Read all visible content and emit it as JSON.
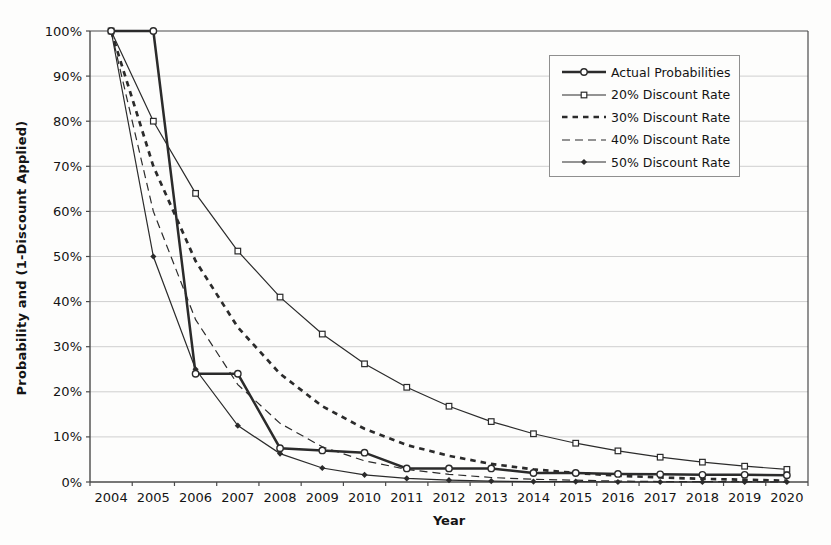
{
  "figure": {
    "background_color": "#fdfdfc",
    "series_color": "#2b2b2b",
    "grid_color": "#cfcfcf",
    "axis_color": "#4a4a4a",
    "text_color": "#141414"
  },
  "chart_data": {
    "type": "line",
    "title": "",
    "xlabel": "Year",
    "ylabel": "Probability and (1-Discount Applied)",
    "ylim": [
      0,
      100
    ],
    "grid": "horizontal",
    "legend_position": "top-right-inside",
    "x": [
      2004,
      2005,
      2006,
      2007,
      2008,
      2009,
      2010,
      2011,
      2012,
      2013,
      2014,
      2015,
      2016,
      2017,
      2018,
      2019,
      2020
    ],
    "x_tick_labels": [
      "2004",
      "2005",
      "2006",
      "2007",
      "2008",
      "2009",
      "2010",
      "2011",
      "2012",
      "2013",
      "2014",
      "2015",
      "2016",
      "2017",
      "2018",
      "2019",
      "2020"
    ],
    "y_tick_labels": [
      "0%",
      "10%",
      "20%",
      "30%",
      "40%",
      "50%",
      "60%",
      "70%",
      "80%",
      "90%",
      "100%"
    ],
    "series": [
      {
        "name": "Actual Probabilities",
        "values": [
          100,
          100,
          24,
          24,
          7.5,
          7,
          6.5,
          3,
          3,
          3,
          2,
          2,
          1.8,
          1.7,
          1.6,
          1.6,
          1.5
        ],
        "line": "thick-solid",
        "marker": "circle-open"
      },
      {
        "name": "20% Discount Rate",
        "values": [
          100,
          80,
          64,
          51.2,
          41,
          32.8,
          26.2,
          21,
          16.8,
          13.4,
          10.7,
          8.6,
          6.9,
          5.5,
          4.4,
          3.5,
          2.8
        ],
        "line": "thin-solid",
        "marker": "square-open"
      },
      {
        "name": "30% Discount Rate",
        "values": [
          100,
          70,
          49,
          34.3,
          24,
          16.8,
          11.8,
          8.2,
          5.8,
          4,
          2.8,
          2,
          1.4,
          1,
          0.7,
          0.5,
          0.3
        ],
        "line": "thick-dashed",
        "marker": "none"
      },
      {
        "name": "40% Discount Rate",
        "values": [
          100,
          60,
          36,
          21.6,
          13,
          7.8,
          4.7,
          2.8,
          1.7,
          1,
          0.6,
          0.4,
          0.2,
          0.1,
          0.1,
          0.1,
          0
        ],
        "line": "thin-dashed",
        "marker": "none"
      },
      {
        "name": "50% Discount Rate",
        "values": [
          100,
          50,
          25,
          12.5,
          6.3,
          3.1,
          1.6,
          0.8,
          0.4,
          0.2,
          0.1,
          0.1,
          0,
          0,
          0,
          0,
          0
        ],
        "line": "thin-solid",
        "marker": "diamond-filled"
      }
    ]
  }
}
